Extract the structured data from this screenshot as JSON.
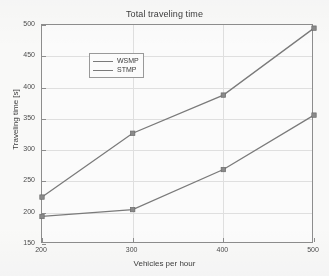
{
  "chart_data": {
    "type": "line",
    "title": "Total traveling time",
    "xlabel": "Vehicles per hour",
    "ylabel": "Traveling time [s]",
    "x": [
      200,
      300,
      400,
      500
    ],
    "xlim": [
      200,
      500
    ],
    "ylim": [
      150,
      500
    ],
    "xticks": [
      "200",
      "300",
      "400",
      "500"
    ],
    "yticks": [
      "150",
      "200",
      "250",
      "300",
      "350",
      "400",
      "450",
      "500"
    ],
    "grid": true,
    "legend_position": "upper-left",
    "series": [
      {
        "name": "WSMP",
        "values": [
          225,
          327,
          388,
          495
        ],
        "color": "#7a7a7a",
        "marker": "square"
      },
      {
        "name": "STMP",
        "values": [
          194,
          205,
          269,
          356
        ],
        "color": "#7a7a7a",
        "marker": "square"
      }
    ]
  },
  "legend": {
    "items": [
      {
        "label": "WSMP"
      },
      {
        "label": "STMP"
      }
    ]
  }
}
